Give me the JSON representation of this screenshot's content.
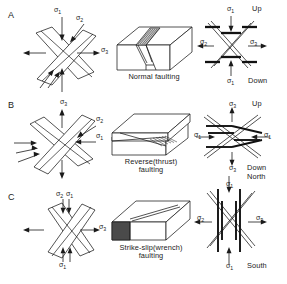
{
  "figure": {
    "rows": [
      {
        "id": "A",
        "label": "A",
        "caption": "Normal faulting",
        "stress_diagram": {
          "name": "normal-stress-block",
          "labels": [
            {
              "text": "σ",
              "sub": "1",
              "role": "vertical-max-compression",
              "x": 56,
              "y": 10
            },
            {
              "text": "σ",
              "sub": "2",
              "role": "intermediate",
              "x": 78,
              "y": 17
            },
            {
              "text": "σ",
              "sub": "3",
              "role": "horizontal-extension",
              "x": 101,
              "y": 48
            }
          ]
        },
        "focal_diagram": {
          "name": "normal-focal-mechanism",
          "labels": [
            {
              "text": "σ",
              "sub": "1",
              "x": 228,
              "y": 9
            },
            {
              "text": "σ",
              "sub": "2",
              "x": 201,
              "y": 43
            },
            {
              "text": "σ",
              "sub": "3",
              "x": 252,
              "y": 43
            },
            {
              "text": "σ",
              "sub": "1",
              "x": 228,
              "y": 79
            }
          ],
          "orientation": [
            {
              "text": "Up",
              "x": 251,
              "y": 7
            },
            {
              "text": "Down",
              "x": 249,
              "y": 78
            }
          ]
        }
      },
      {
        "id": "B",
        "label": "B",
        "caption_line1": "Reverse(thrust)",
        "caption_line2": "faulting",
        "stress_diagram": {
          "name": "reverse-stress-block",
          "labels": [
            {
              "text": "σ",
              "sub": "3",
              "role": "vertical-extension",
              "x": 62,
              "y": 101
            },
            {
              "text": "σ",
              "sub": "2",
              "role": "intermediate",
              "x": 96,
              "y": 118
            },
            {
              "text": "σ",
              "sub": "1",
              "role": "horizontal-compression",
              "x": 96,
              "y": 135
            }
          ]
        },
        "focal_diagram": {
          "name": "reverse-focal-mechanism",
          "labels": [
            {
              "text": "σ",
              "sub": "3",
              "x": 230,
              "y": 104
            },
            {
              "text": "σ",
              "sub": "1",
              "x": 196,
              "y": 138
            },
            {
              "text": "σ",
              "sub": "1",
              "x": 264,
              "y": 138
            },
            {
              "text": "σ",
              "sub": "3",
              "x": 230,
              "y": 166
            }
          ],
          "orientation": [
            {
              "text": "Up",
              "x": 252,
              "y": 101
            },
            {
              "text": "Down",
              "x": 248,
              "y": 165
            },
            {
              "text": "North",
              "x": 248,
              "y": 174
            }
          ]
        }
      },
      {
        "id": "C",
        "label": "C",
        "caption_line1": "Strike-slip(wrench)",
        "caption_line2": "faulting",
        "stress_diagram": {
          "name": "strikeslip-stress-block",
          "labels": [
            {
              "text": "σ",
              "sub": "2",
              "role": "vertical",
              "x": 57,
              "y": 192
            },
            {
              "text": "σ",
              "sub": "1",
              "role": "horizontal-compression",
              "x": 67,
              "y": 192
            },
            {
              "text": "σ",
              "sub": "3",
              "role": "horizontal-extension",
              "x": 100,
              "y": 225
            },
            {
              "text": "σ",
              "sub": "1",
              "role": "horizontal-compression",
              "x": 60,
              "y": 260
            }
          ]
        },
        "focal_diagram": {
          "name": "strikeslip-focal-mechanism",
          "labels": [
            {
              "text": "σ",
              "sub": "1",
              "x": 228,
              "y": 183
            },
            {
              "text": "σ",
              "sub": "2",
              "x": 199,
              "y": 218
            },
            {
              "text": "σ",
              "sub": "3",
              "x": 257,
              "y": 218
            },
            {
              "text": "σ",
              "sub": "1",
              "x": 228,
              "y": 262
            }
          ],
          "orientation": [
            {
              "text": "South",
              "x": 249,
              "y": 262
            }
          ]
        }
      }
    ],
    "colors": {
      "ink": "#1a1a1a",
      "background": "#ffffff",
      "shadow_fill": "#4a4a4a",
      "light_fill": "#cfcfcf"
    }
  }
}
